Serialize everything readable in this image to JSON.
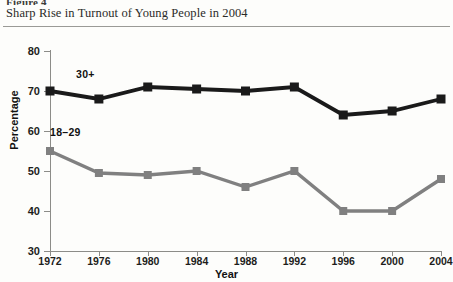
{
  "figure": {
    "number": "Figure 4",
    "title": "Sharp Rise in Turnout of Young People in 2004"
  },
  "annotations": {
    "older": "30+",
    "younger": "18–29"
  },
  "colors": {
    "older_series": "#1a1a1a",
    "younger_series": "#808080",
    "axis": "#8c8c88",
    "rule": "#9a9a96",
    "page_background": "#fdfdfb"
  },
  "chart_data": {
    "type": "line",
    "title": "Sharp Rise in Turnout of Young People in 2004",
    "xlabel": "Year",
    "ylabel": "Percentage",
    "categories": [
      "1972",
      "1976",
      "1980",
      "1984",
      "1988",
      "1992",
      "1996",
      "2000",
      "2004"
    ],
    "x": [
      1972,
      1976,
      1980,
      1984,
      1988,
      1992,
      1996,
      2000,
      2004
    ],
    "xlim": [
      1972,
      2004
    ],
    "ylim": [
      30,
      80
    ],
    "yticks": [
      30,
      40,
      50,
      60,
      70,
      80
    ],
    "xticks": [
      1972,
      1976,
      1980,
      1984,
      1988,
      1992,
      1996,
      2000,
      2004
    ],
    "grid": false,
    "legend": "inline-annotations",
    "marker": "square",
    "series": [
      {
        "name": "30+",
        "color": "#1a1a1a",
        "values": [
          70,
          68,
          71,
          70.5,
          70,
          71,
          64,
          65,
          68
        ]
      },
      {
        "name": "18–29",
        "color": "#808080",
        "values": [
          55,
          49.5,
          49,
          50,
          46,
          50,
          40,
          40,
          48
        ]
      }
    ]
  }
}
